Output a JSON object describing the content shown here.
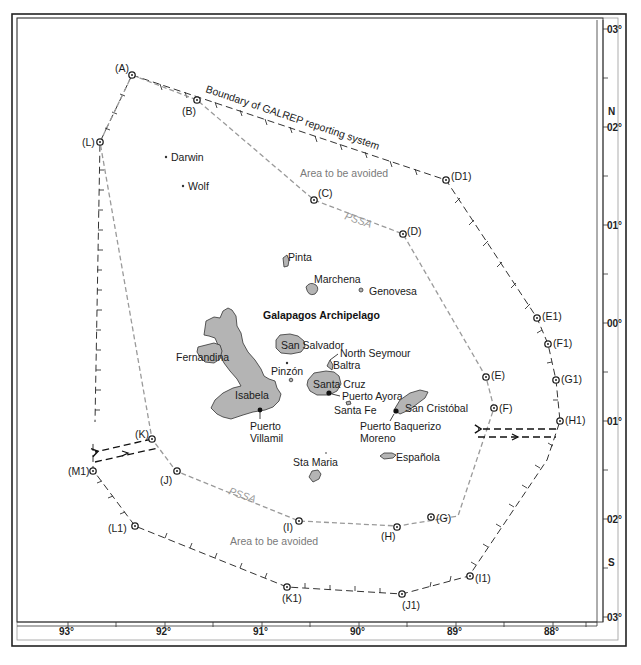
{
  "map": {
    "title": "Galapagos Archipelago",
    "boundary_label": "Boundary of GALREP reporting system",
    "area_avoided_labels": [
      "Area to be avoided",
      "Area to be avoided"
    ],
    "pssa_labels": [
      "PSSA",
      "PSSA"
    ],
    "colors": {
      "land": "#b4b4b4",
      "pssa_line": "#9a9a9a",
      "boundary_line": "#333333",
      "frame": "#222222"
    }
  },
  "axes": {
    "longitude_ticks": [
      "93°",
      "92°",
      "91°",
      "90°",
      "89°",
      "88°"
    ],
    "latitude_ticks_north": [
      "03°",
      "02°",
      "01°"
    ],
    "latitude_equator": "00°",
    "latitude_ticks_south": [
      "01°",
      "02°",
      "03°"
    ],
    "north_label": "N",
    "south_label": "S"
  },
  "pssa_waypoints": [
    "(A)",
    "(B)",
    "(C)",
    "(D)",
    "(E)",
    "(F)",
    "(G)",
    "(H)",
    "(I)",
    "(J)",
    "(K)",
    "(L)"
  ],
  "galrep_waypoints": [
    "(D1)",
    "(E1)",
    "(F1)",
    "(G1)",
    "(H1)",
    "(I1)",
    "(J1)",
    "(K1)",
    "(L1)",
    "(M1)"
  ],
  "islands": {
    "darwin": "Darwin",
    "wolf": "Wolf",
    "pinta": "Pinta",
    "marchena": "Marchena",
    "genovesa": "Genovesa",
    "fernandina": "Fernandina",
    "isabela": "Isabela",
    "san_salvador": "San Salvador",
    "north_seymour": "North Seymour",
    "baltra": "Baltra",
    "pinzon": "Pinzón",
    "santa_cruz": "Santa Cruz",
    "santa_fe": "Santa Fe",
    "san_cristobal": "San Cristóbal",
    "sta_maria": "Sta Maria",
    "espanola": "Española"
  },
  "ports": {
    "puerto_ayora": "Puerto Ayora",
    "puerto_villamil_1": "Puerto",
    "puerto_villamil_2": "Villamil",
    "puerto_baquerizo_1": "Puerto Baquerizo",
    "puerto_baquerizo_2": "Moreno"
  }
}
